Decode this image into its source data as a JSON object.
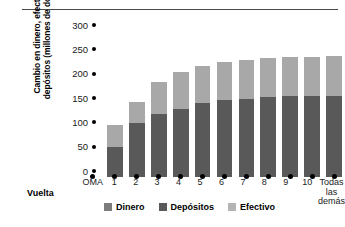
{
  "chart_data": {
    "type": "bar",
    "stacked": true,
    "title": "",
    "xlabel": "Vuelta",
    "ylabel": "Cambio en dinero, efectivo y depósitos (millones de dólares)",
    "ylabel_lines": [
      "Cambio en dinero, efectivo y",
      "depósitos (millones de dólares)"
    ],
    "ylim": [
      0,
      300
    ],
    "yticks": [
      300,
      250,
      200,
      150,
      100,
      50,
      0
    ],
    "ytick_labels": [
      "300",
      "250",
      "200",
      "150",
      "100",
      "50",
      "0"
    ],
    "grid": false,
    "legend_position": "bottom",
    "categories": [
      "OMA",
      "1",
      "2",
      "3",
      "4",
      "5",
      "6",
      "7",
      "8",
      "9",
      "10",
      "Todas las demás"
    ],
    "category_labels": [
      {
        "line1": "OMA",
        "line2": ""
      },
      {
        "line1": "1",
        "line2": ""
      },
      {
        "line1": "2",
        "line2": ""
      },
      {
        "line1": "3",
        "line2": ""
      },
      {
        "line1": "4",
        "line2": ""
      },
      {
        "line1": "5",
        "line2": ""
      },
      {
        "line1": "6",
        "line2": ""
      },
      {
        "line1": "7",
        "line2": ""
      },
      {
        "line1": "8",
        "line2": ""
      },
      {
        "line1": "9",
        "line2": ""
      },
      {
        "line1": "10",
        "line2": ""
      },
      {
        "line1": "Todas",
        "line2": "las demás"
      }
    ],
    "series": [
      {
        "name": "Depósitos",
        "color": "#595959",
        "values": [
          0,
          62,
          111,
          129,
          140,
          152,
          158,
          160,
          164,
          166,
          166,
          166
        ]
      },
      {
        "name": "Efectivo",
        "color": "#a8a8a8",
        "values": [
          0,
          45,
          44,
          66,
          76,
          76,
          78,
          81,
          81,
          80,
          81,
          82
        ]
      }
    ],
    "totals": [
      0,
      107,
      155,
      195,
      216,
      228,
      236,
      241,
      245,
      246,
      247,
      248
    ],
    "legend": [
      {
        "label": "Dinero",
        "color": "#7d7d7d"
      },
      {
        "label": "Depósitos",
        "color": "#595959"
      },
      {
        "label": "Efectivo",
        "color": "#b4b4b4"
      }
    ]
  }
}
